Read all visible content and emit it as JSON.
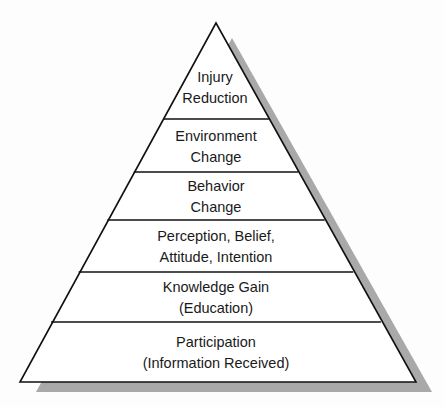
{
  "diagram": {
    "type": "pyramid",
    "tiers_top_to_bottom": [
      {
        "lines": [
          "Injury",
          "Reduction"
        ]
      },
      {
        "lines": [
          "Environment",
          "Change"
        ]
      },
      {
        "lines": [
          "Behavior",
          "Change"
        ]
      },
      {
        "lines": [
          "Perception, Belief,",
          "Attitude, Intention"
        ]
      },
      {
        "lines": [
          "Knowledge Gain",
          "(Education)"
        ]
      },
      {
        "lines": [
          "Participation",
          "(Information Received)"
        ]
      }
    ],
    "colors": {
      "fill": "#ffffff",
      "stroke": "#111111",
      "shadow": "#a9a9a9"
    }
  }
}
